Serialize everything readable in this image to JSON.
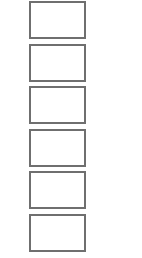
{
  "slots": {
    "count": 6,
    "border_color": "#6f6f6f",
    "background_color": "#ffffff",
    "items": [
      {
        "label": ""
      },
      {
        "label": ""
      },
      {
        "label": ""
      },
      {
        "label": ""
      },
      {
        "label": ""
      },
      {
        "label": ""
      }
    ]
  }
}
